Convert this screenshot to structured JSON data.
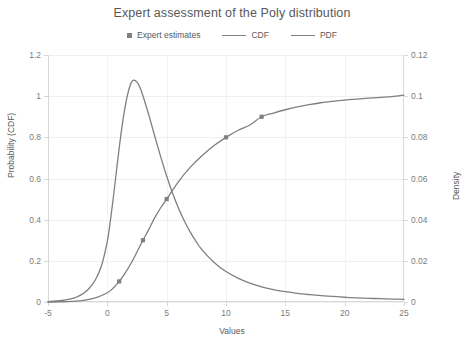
{
  "chart_data": {
    "type": "line",
    "title": "Expert assessment of the Poly distribution",
    "xlabel": "Values",
    "ylabel": "Probability (CDF)",
    "ylabel_secondary": "Density",
    "xlim": [
      -5,
      25
    ],
    "ylim": [
      0,
      1.2
    ],
    "ylim_secondary": [
      0,
      0.12
    ],
    "xticks": [
      "-5",
      "0",
      "5",
      "10",
      "15",
      "20",
      "25"
    ],
    "xtick_values": [
      -5,
      0,
      5,
      10,
      15,
      20,
      25
    ],
    "yticks": [
      "0",
      "0.2",
      "0.4",
      "0.6",
      "0.8",
      "1",
      "1.2"
    ],
    "ytick_values": [
      0,
      0.2,
      0.4,
      0.6,
      0.8,
      1,
      1.2
    ],
    "yticks_secondary": [
      "0",
      "0.02",
      "0.04",
      "0.06",
      "0.08",
      "0.1",
      "0.12"
    ],
    "ytick_values_secondary": [
      0,
      0.02,
      0.04,
      0.06,
      0.08,
      0.1,
      0.12
    ],
    "grid": true,
    "legend_position": "top",
    "legend": [
      {
        "label": "Expert estimates",
        "type": "marker",
        "color": "#808080"
      },
      {
        "label": "CDF",
        "type": "line",
        "color": "#7f7f7f"
      },
      {
        "label": "PDF",
        "type": "line",
        "color": "#7f7f7f"
      }
    ],
    "series": [
      {
        "name": "Expert estimates",
        "type": "scatter",
        "axis": "left",
        "color": "#808080",
        "points": [
          {
            "x": 1,
            "y": 0.1
          },
          {
            "x": 3,
            "y": 0.3
          },
          {
            "x": 5,
            "y": 0.5
          },
          {
            "x": 10,
            "y": 0.8
          },
          {
            "x": 13,
            "y": 0.9
          }
        ]
      },
      {
        "name": "CDF",
        "type": "line",
        "axis": "left",
        "color": "#7f7f7f",
        "x": [
          -5,
          -4,
          -3,
          -2,
          -1,
          0,
          0.5,
          1,
          1.5,
          2,
          2.5,
          3,
          3.5,
          4,
          4.5,
          5,
          6,
          7,
          8,
          9,
          10,
          11,
          12,
          13,
          14,
          15,
          16,
          17,
          18,
          19,
          20,
          21,
          22,
          23,
          24,
          25
        ],
        "y": [
          0,
          0.001,
          0.003,
          0.008,
          0.02,
          0.045,
          0.068,
          0.1,
          0.14,
          0.188,
          0.243,
          0.3,
          0.353,
          0.41,
          0.458,
          0.5,
          0.585,
          0.655,
          0.712,
          0.76,
          0.8,
          0.833,
          0.86,
          0.9,
          0.918,
          0.934,
          0.948,
          0.959,
          0.968,
          0.975,
          0.981,
          0.986,
          0.99,
          0.994,
          0.998,
          1.005
        ]
      },
      {
        "name": "PDF",
        "type": "line",
        "axis": "right",
        "color": "#7f7f7f",
        "x": [
          -5,
          -4,
          -3,
          -2.5,
          -2,
          -1.5,
          -1,
          -0.5,
          0,
          0.25,
          0.5,
          0.75,
          1,
          1.25,
          1.5,
          1.75,
          2,
          2.2,
          2.5,
          2.75,
          3,
          3.5,
          4,
          4.5,
          5,
          5.5,
          6,
          6.5,
          7,
          7.5,
          8,
          9,
          10,
          11,
          12,
          13,
          14,
          15,
          16,
          17,
          18,
          19,
          20,
          21,
          22,
          23,
          24,
          25
        ],
        "y": [
          0.0002,
          0.0006,
          0.0016,
          0.0026,
          0.0042,
          0.0068,
          0.0108,
          0.0175,
          0.0295,
          0.0392,
          0.0505,
          0.0628,
          0.0748,
          0.0858,
          0.0948,
          0.1018,
          0.1064,
          0.1078,
          0.1068,
          0.1042,
          0.1002,
          0.0908,
          0.0805,
          0.0705,
          0.0612,
          0.0528,
          0.0455,
          0.0392,
          0.0338,
          0.0292,
          0.0252,
          0.0192,
          0.0148,
          0.0116,
          0.0092,
          0.0074,
          0.006,
          0.005,
          0.0042,
          0.0036,
          0.0031,
          0.0027,
          0.0023,
          0.002,
          0.0018,
          0.0016,
          0.0014,
          0.0013
        ]
      }
    ]
  }
}
